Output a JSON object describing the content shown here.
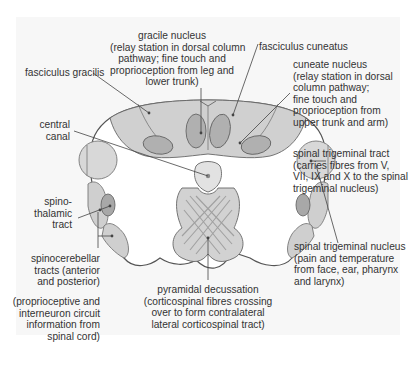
{
  "labels": {
    "gracile_nucleus": [
      "gracile nucleus",
      "(relay station in dorsal column",
      "pathway; fine touch and",
      "proprioception from leg and",
      "lower trunk)"
    ],
    "fasciculus_gracilis": [
      "fasciculus gracilis"
    ],
    "fasciculus_cuneatus": [
      "fasciculus cuneatus"
    ],
    "cuneate_nucleus": [
      "cuneate nucleus",
      "(relay station in dorsal",
      "column pathway;",
      "fine touch and",
      "proprioception from",
      "upper trunk and arm)"
    ],
    "central_canal": [
      "central",
      "canal"
    ],
    "spinal_trigeminal_tract": [
      "spinal trigeminal tract",
      "(carries fibres from V,",
      "VII, IX and X to the spinal",
      "trigeminal nucleus)"
    ],
    "spinothalamic_tract": [
      "spino-",
      "thalamic",
      "tract"
    ],
    "spinocerebellar_tracts": [
      "spinocerebellar",
      "tracts (anterior",
      "and posterior)"
    ],
    "spinocerebellar_note": [
      "(proprioceptive and",
      "interneuron circuit",
      "information from",
      "spinal cord)"
    ],
    "spinal_trigeminal_nucleus": [
      "spinal trigeminal nucleus",
      "(pain and temperature",
      "from face, ear, pharynx",
      "and larynx)"
    ],
    "pyramidal_decussation": [
      "pyramidal decussation",
      "(corticospinal fibres crossing",
      "over to form contralateral",
      "lateral corticospinal tract)"
    ]
  },
  "colors": {
    "background_panel": "#f7f7f7",
    "outline": "#555555",
    "light_fill": "#d9d9d9",
    "medium_fill": "#c4c4c4",
    "dark_fill": "#a8a8a8",
    "decussation_lines": "#a0a0a0"
  }
}
